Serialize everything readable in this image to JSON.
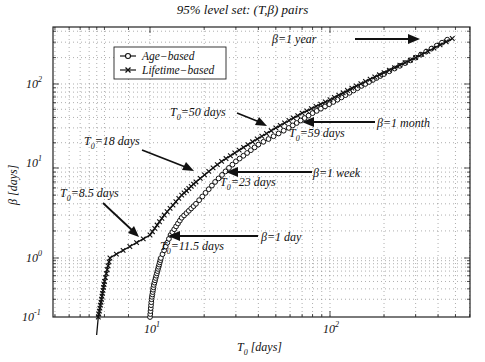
{
  "chart_data": {
    "type": "line",
    "title": "95% level set: (T,β) pairs",
    "xlabel": "T0 [days]",
    "ylabel": "β [days]",
    "xscale": "log",
    "yscale": "log",
    "xlim": [
      3,
      600
    ],
    "ylim": [
      0.1,
      450
    ],
    "grid": true,
    "legend_position": "upper left",
    "x_ticks": [
      {
        "label": "10",
        "exp": "1",
        "value": 10
      },
      {
        "label": "10",
        "exp": "2",
        "value": 100
      }
    ],
    "y_ticks": [
      {
        "label": "10",
        "exp": "-1",
        "value": 0.1
      },
      {
        "label": "10",
        "exp": "0",
        "value": 1
      },
      {
        "label": "10",
        "exp": "1",
        "value": 10
      },
      {
        "label": "10",
        "exp": "2",
        "value": 100
      }
    ],
    "series": [
      {
        "name": "Age-based",
        "marker": "o",
        "points": [
          [
            10,
            0.1
          ],
          [
            10.2,
            0.2
          ],
          [
            10.5,
            0.35
          ],
          [
            11,
            0.6
          ],
          [
            11.5,
            1
          ],
          [
            13,
            1.8
          ],
          [
            15,
            2.8
          ],
          [
            18,
            4
          ],
          [
            23,
            7
          ],
          [
            30,
            12
          ],
          [
            40,
            19
          ],
          [
            59,
            30
          ],
          [
            80,
            45
          ],
          [
            110,
            65
          ],
          [
            150,
            95
          ],
          [
            200,
            130
          ],
          [
            300,
            200
          ],
          [
            450,
            320
          ]
        ]
      },
      {
        "name": "Lifetime-based",
        "marker": "x",
        "points": [
          [
            6.5,
            0.1
          ],
          [
            7,
            0.2
          ],
          [
            7.5,
            0.4
          ],
          [
            8.5,
            1
          ],
          [
            10,
            1.8
          ],
          [
            12,
            3
          ],
          [
            15,
            5
          ],
          [
            18,
            7
          ],
          [
            25,
            12
          ],
          [
            35,
            19
          ],
          [
            50,
            30
          ],
          [
            70,
            45
          ],
          [
            100,
            65
          ],
          [
            140,
            95
          ],
          [
            200,
            135
          ],
          [
            300,
            200
          ],
          [
            480,
            330
          ]
        ]
      }
    ],
    "annotations": [
      {
        "text": "β=1 year",
        "arrow_to": "curve top right"
      },
      {
        "text": "β=1 month",
        "arrow_to": "T0=59 days"
      },
      {
        "text": "β=1 week",
        "arrow_to": "T0=23 days"
      },
      {
        "text": "β=1 day",
        "arrow_to": "T0=11.5 days"
      },
      {
        "text": "T0=50 days"
      },
      {
        "text": "T0=59 days"
      },
      {
        "text": "T0=18 days"
      },
      {
        "text": "T0=23 days"
      },
      {
        "text": "T0=8.5 days"
      },
      {
        "text": "T0=11.5 days"
      }
    ]
  },
  "title": "95% level set:  (T,β) pairs",
  "legend": {
    "age": "Age−based",
    "lifetime": "Lifetime−based"
  },
  "axis": {
    "x_label": "T",
    "x_sub": "0",
    "x_unit": " [days]",
    "y_label": "β [days]"
  },
  "ticks": {
    "base": "10",
    "x": [
      "1",
      "2"
    ],
    "y": [
      "2",
      "1",
      "0",
      "-1"
    ]
  },
  "ann": {
    "year": "β=1 year",
    "month": "β=1 month",
    "week": "β=1 week",
    "day": "β=1 day",
    "t50": "=50 days",
    "t59": "=59 days",
    "t18": "=18 days",
    "t23": "=23 days",
    "t85": "=8.5 days",
    "t115": "=11.5 days",
    "T": "T",
    "sub": "0"
  }
}
